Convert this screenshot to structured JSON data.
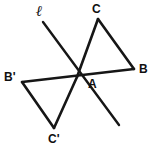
{
  "figure": {
    "background_color": "#ffffff",
    "stroke_color": "#161616",
    "label_color": "#101010",
    "width": 159,
    "height": 159
  },
  "labels": {
    "a": "A",
    "b": "B",
    "c": "C",
    "b_prime": "B'",
    "c_prime": "C'",
    "line_l": "ℓ"
  },
  "points": {
    "A": {
      "x": 77,
      "y": 77
    },
    "B": {
      "x": 134,
      "y": 69
    },
    "C": {
      "x": 98,
      "y": 19
    },
    "Bp": {
      "x": 22,
      "y": 82
    },
    "Cp": {
      "x": 54,
      "y": 128
    }
  },
  "label_positions": {
    "a": {
      "x": 88,
      "y": 78
    },
    "b": {
      "x": 139,
      "y": 63
    },
    "c": {
      "x": 92,
      "y": 3
    },
    "b_prime": {
      "x": 4,
      "y": 71
    },
    "c_prime": {
      "x": 48,
      "y": 133
    },
    "line_l": {
      "x": 36,
      "y": 4
    }
  },
  "segments": [
    {
      "name": "segment-AC",
      "from": "A",
      "to": "C"
    },
    {
      "name": "segment-CB",
      "from": "C",
      "to": "B"
    },
    {
      "name": "segment-AB",
      "from": "A",
      "to": "B"
    },
    {
      "name": "segment-A-Bprime",
      "from": "A",
      "to": "Bp"
    },
    {
      "name": "segment-Bprime-Cprime",
      "from": "Bp",
      "to": "Cp"
    },
    {
      "name": "segment-A-Cprime",
      "from": "A",
      "to": "Cp"
    }
  ],
  "line_l": {
    "name": "line-l",
    "start": {
      "x": 43,
      "y": 22
    },
    "end": {
      "x": 119,
      "y": 125
    }
  },
  "stroke_widths": {
    "triangle": 2.6,
    "transversal": 2.4,
    "line_l": 2.4
  }
}
